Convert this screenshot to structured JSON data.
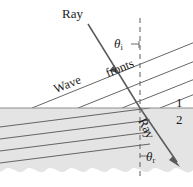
{
  "figure": {
    "background_color": "#ffffff",
    "line_color": "#4a4a4a",
    "text_color": "#1b1b1b",
    "medium2_fill": "#e3e3e3",
    "boundary_color": "#8c8c8c",
    "dashed_normal_color": "#6e6e6e"
  },
  "labels": {
    "ray_incident": "Ray",
    "ray_refracted": "Ray",
    "theta_i_symbol": "θ",
    "theta_i_subscript": "i",
    "theta_r_symbol": "θ",
    "theta_r_subscript": "r",
    "wave": "Wave",
    "fronts": "fronts",
    "medium_1": "1",
    "medium_2": "2"
  },
  "geometry": {
    "boundary_y": 108,
    "incidence_point_x": 140,
    "incidence_point_y": 108,
    "normal_line_x": 140,
    "normal_top_y": 18,
    "normal_bottom_y": 176,
    "incident_ray_start_x": 88,
    "incident_ray_start_y": 24,
    "refracted_ray_end_x": 178,
    "refracted_ray_end_y": 164,
    "incident_wavefront_angle_deg": -22,
    "refracted_wavefront_angle_deg": -16,
    "theta_i_degrees": 33,
    "theta_r_degrees": 22,
    "incident_wavefront_count": 4,
    "refracted_wavefront_count": 4
  }
}
